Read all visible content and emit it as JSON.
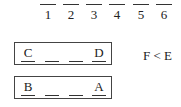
{
  "positions": {
    "labels": [
      "1",
      "2",
      "3",
      "4",
      "5",
      "6"
    ]
  },
  "rows": [
    {
      "cells": [
        "C",
        "",
        "",
        "D"
      ]
    },
    {
      "cells": [
        "B",
        "",
        "",
        "A"
      ]
    }
  ],
  "clue": "F < E"
}
